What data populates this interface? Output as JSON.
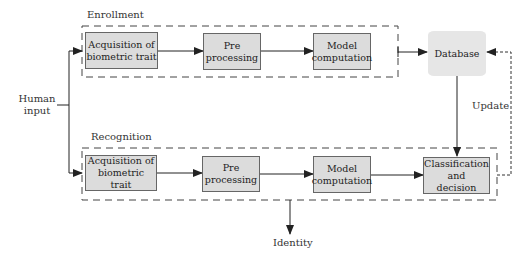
{
  "diagram": {
    "type": "flowchart",
    "groups": {
      "enrollment": {
        "label": "Enrollment",
        "steps": [
          {
            "id": "acq_enroll",
            "label": "Acquisition of biometric trait",
            "line1": "Acquisition of",
            "line2": "biometric trait"
          },
          {
            "id": "pre_enroll",
            "label": "Pre processing",
            "line1": "Pre",
            "line2": "processing"
          },
          {
            "id": "model_enroll",
            "label": "Model computation",
            "line1": "Model",
            "line2": "computation"
          }
        ]
      },
      "recognition": {
        "label": "Recognition",
        "steps": [
          {
            "id": "acq_recog",
            "label": "Acquisition of biometric trait",
            "line1": "Acquisition of",
            "line2": "biometric trait"
          },
          {
            "id": "pre_recog",
            "label": "Pre processing",
            "line1": "Pre",
            "line2": "processing"
          },
          {
            "id": "model_recog",
            "label": "Model computation",
            "line1": "Model",
            "line2": "computation"
          },
          {
            "id": "classify",
            "label": "Classification and decision",
            "line1": "Classification",
            "line2": "and",
            "line3": "decision"
          }
        ]
      }
    },
    "database": {
      "label": "Database"
    },
    "input": {
      "line1": "Human",
      "line2": "input"
    },
    "output": {
      "label": "Identity"
    },
    "update_label": "Update",
    "edges": [
      {
        "from": "Human input",
        "to": "acq_enroll",
        "style": "solid"
      },
      {
        "from": "Human input",
        "to": "acq_recog",
        "style": "solid"
      },
      {
        "from": "acq_enroll",
        "to": "pre_enroll",
        "style": "solid"
      },
      {
        "from": "pre_enroll",
        "to": "model_enroll",
        "style": "solid"
      },
      {
        "from": "enrollment",
        "to": "database",
        "style": "solid"
      },
      {
        "from": "acq_recog",
        "to": "pre_recog",
        "style": "solid"
      },
      {
        "from": "pre_recog",
        "to": "model_recog",
        "style": "solid"
      },
      {
        "from": "model_recog",
        "to": "classify",
        "style": "solid"
      },
      {
        "from": "database",
        "to": "classify",
        "style": "solid"
      },
      {
        "from": "classify",
        "to": "database",
        "style": "dotted",
        "label": "Update"
      },
      {
        "from": "recognition",
        "to": "Identity",
        "style": "solid"
      }
    ],
    "colors": {
      "box_fill": "#dcdcdc",
      "box_border": "#666666",
      "database_fill": "#e6e6e6",
      "line": "#222222"
    }
  }
}
